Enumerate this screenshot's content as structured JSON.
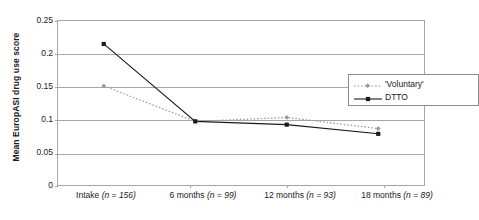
{
  "chart_data": {
    "type": "line",
    "title": "",
    "xlabel": "",
    "ylabel": "Mean EuropASI drug use score",
    "categories": [
      "Intake (n = 156)",
      "6 months (n = 99)",
      "12 months (n = 93)",
      "18 months (n = 89)"
    ],
    "category_parts": [
      {
        "name": "Intake",
        "n_label": "(n = 156)",
        "n": 156
      },
      {
        "name": "6 months",
        "n_label": "(n = 99)",
        "n": 99
      },
      {
        "name": "12 months",
        "n_label": "(n = 93)",
        "n": 93
      },
      {
        "name": "18 months",
        "n_label": "(n = 89)",
        "n": 89
      }
    ],
    "series": [
      {
        "name": "'Voluntary'",
        "values": [
          0.151,
          0.097,
          0.103,
          0.086
        ],
        "color": "#9a9a9a",
        "style": "dotted",
        "marker": "diamond"
      },
      {
        "name": "DTTO",
        "values": [
          0.215,
          0.097,
          0.092,
          0.078
        ],
        "color": "#1a1a1a",
        "style": "solid",
        "marker": "square"
      }
    ],
    "ylim": [
      0,
      0.25
    ],
    "yticks": [
      0,
      0.05,
      0.1,
      0.15,
      0.2,
      0.25
    ],
    "ytick_labels": [
      "0",
      "0.05",
      "0.1",
      "0.15",
      "0.2",
      "0.25"
    ],
    "grid": true,
    "grid_axis": "y",
    "legend_position": "upper-right-inside",
    "legend_entries": [
      "'Voluntary'",
      "DTTO"
    ]
  },
  "colors": {
    "axis": "#a6a6a6",
    "grid": "#a6a6a6",
    "voluntary": "#9a9a9a",
    "dtto": "#1a1a1a",
    "background": "#ffffff"
  }
}
